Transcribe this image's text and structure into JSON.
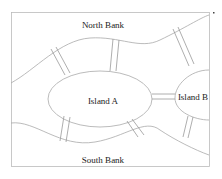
{
  "diagram": {
    "labels": {
      "north": "North Bank",
      "south": "South Bank",
      "island_a": "Island A",
      "island_b": "Island B"
    },
    "colors": {
      "line": "#aaaaaa",
      "text": "#222222"
    },
    "bridge_count": 7
  }
}
